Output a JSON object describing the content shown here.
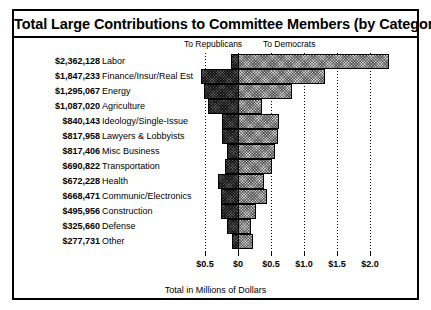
{
  "chart_data": {
    "type": "bar",
    "orientation": "horizontal",
    "subtype": "diverging-stacked",
    "title": "Total Large Contributions to Committee Members (by Category)",
    "xlabel": "Total in Millions of Dollars",
    "ylabel": "",
    "grid": true,
    "legend_position": "top",
    "legend": [
      {
        "name": "To Republicans",
        "direction": "left",
        "color": "#595959"
      },
      {
        "name": "To Democrats",
        "direction": "right",
        "color": "#c9c9c9"
      }
    ],
    "axis": {
      "tick_labels": [
        "$0.5",
        "$0",
        "$0.5",
        "$1.0",
        "$1.5",
        "$2.0"
      ],
      "tick_values": [
        -0.5,
        0,
        0.5,
        1.0,
        1.5,
        2.0
      ],
      "xlim": [
        -0.62,
        2.2
      ],
      "units": "millions of dollars"
    },
    "categories": [
      "Labor",
      "Finance/Insur/Real Est",
      "Energy",
      "Agriculture",
      "Ideology/Single-Issue",
      "Lawyers & Lobbyists",
      "Misc Business",
      "Transportation",
      "Health",
      "Communic/Electronics",
      "Construction",
      "Defense",
      "Other"
    ],
    "totals_formatted": [
      "$2,362,128",
      "$1,847,233",
      "$1,295,067",
      "$1,087,020",
      "$840,143",
      "$817,958",
      "$817,406",
      "$690,822",
      "$672,228",
      "$668,471",
      "$495,956",
      "$325,660",
      "$277,731"
    ],
    "totals": [
      2362128,
      1847233,
      1295067,
      1087020,
      840143,
      817958,
      817406,
      690822,
      672228,
      668471,
      495956,
      325660,
      277731
    ],
    "series": [
      {
        "name": "To Republicans",
        "values": [
          -0.1,
          -0.56,
          -0.51,
          -0.46,
          -0.25,
          -0.25,
          -0.16,
          -0.2,
          -0.3,
          -0.26,
          -0.26,
          -0.16,
          -0.09
        ]
      },
      {
        "name": "To Democrats",
        "values": [
          2.26,
          1.29,
          0.79,
          0.33,
          0.59,
          0.57,
          0.53,
          0.49,
          0.37,
          0.41,
          0.24,
          0.17,
          0.19
        ]
      }
    ]
  },
  "rows": [
    {
      "amount": "$2,362,128",
      "label": "Labor",
      "rep": -0.1,
      "dem": 2.26
    },
    {
      "amount": "$1,847,233",
      "label": "Finance/Insur/Real Est",
      "rep": -0.56,
      "dem": 1.29
    },
    {
      "amount": "$1,295,067",
      "label": "Energy",
      "rep": -0.51,
      "dem": 0.79
    },
    {
      "amount": "$1,087,020",
      "label": "Agriculture",
      "rep": -0.46,
      "dem": 0.33
    },
    {
      "amount": "$840,143",
      "label": "Ideology/Single-Issue",
      "rep": -0.25,
      "dem": 0.59
    },
    {
      "amount": "$817,958",
      "label": "Lawyers & Lobbyists",
      "rep": -0.25,
      "dem": 0.57
    },
    {
      "amount": "$817,406",
      "label": "Misc Business",
      "rep": -0.16,
      "dem": 0.53
    },
    {
      "amount": "$690,822",
      "label": "Transportation",
      "rep": -0.2,
      "dem": 0.49
    },
    {
      "amount": "$672,228",
      "label": "Health",
      "rep": -0.3,
      "dem": 0.37
    },
    {
      "amount": "$668,471",
      "label": "Communic/Electronics",
      "rep": -0.26,
      "dem": 0.41
    },
    {
      "amount": "$495,956",
      "label": "Construction",
      "rep": -0.26,
      "dem": 0.24
    },
    {
      "amount": "$325,660",
      "label": "Defense",
      "rep": -0.16,
      "dem": 0.17
    },
    {
      "amount": "$277,731",
      "label": "Other",
      "rep": -0.09,
      "dem": 0.19
    }
  ],
  "legend": {
    "republicans": "To Republicans",
    "democrats": "To Democrats"
  },
  "title": "Total Large Contributions to Committee Members (by Category)",
  "axis_title": "Total in Millions of Dollars",
  "colors": {
    "republican_fill": "#595959",
    "democrat_fill": "#c9c9c9",
    "outline": "#000000",
    "background": "#ffffff"
  }
}
